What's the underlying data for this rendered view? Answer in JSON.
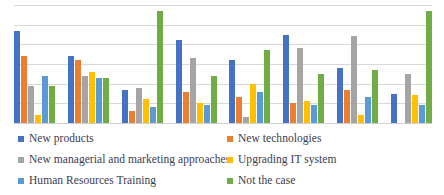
{
  "chart_data": {
    "type": "bar",
    "title": "",
    "subtitle": "",
    "xlabel": "",
    "ylabel": "",
    "ylim": [
      0,
      60
    ],
    "grid": true,
    "gridline_values": [
      0,
      10,
      20,
      30,
      40,
      50,
      60
    ],
    "legend_position": "bottom",
    "tick_labels": [],
    "categories": [
      "1",
      "2",
      "3",
      "4",
      "5",
      "6",
      "7",
      "8"
    ],
    "series": [
      {
        "name": "New products",
        "color": "#4472C4",
        "values": [
          47,
          34,
          17,
          42,
          32,
          45,
          28,
          15
        ]
      },
      {
        "name": "New technologies",
        "color": "#ED7D31",
        "values": [
          34,
          32,
          6,
          16,
          13,
          10,
          17,
          0
        ]
      },
      {
        "name": "New managerial and marketing approaches",
        "color": "#A5A5A5",
        "values": [
          19,
          24,
          18,
          33,
          3,
          38,
          44,
          25
        ]
      },
      {
        "name": "Upgrading IT system",
        "color": "#FFC000",
        "values": [
          4,
          26,
          12,
          10,
          20,
          11,
          4,
          14
        ]
      },
      {
        "name": "Human Resources Training",
        "color": "#5B9BD5",
        "values": [
          24,
          23,
          8,
          9,
          16,
          9,
          13,
          9
        ]
      },
      {
        "name": "Not the case",
        "color": "#70AD47",
        "values": [
          19,
          23,
          57,
          24,
          37,
          25,
          27,
          57
        ]
      }
    ]
  },
  "legend": {
    "items": [
      {
        "label": "New products",
        "color": "#4472C4"
      },
      {
        "label": "New technologies",
        "color": "#ED7D31"
      },
      {
        "label": "New managerial and marketing approaches",
        "color": "#A5A5A5"
      },
      {
        "label": "Upgrading IT system",
        "color": "#FFC000"
      },
      {
        "label": "Human Resources Training",
        "color": "#5B9BD5"
      },
      {
        "label": "Not the case",
        "color": "#70AD47"
      }
    ]
  }
}
